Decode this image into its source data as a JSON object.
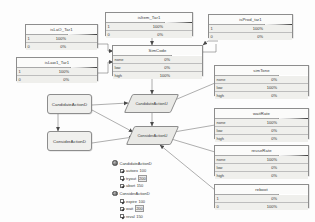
{
  "diagram": {
    "type": "bayesian-influence-diagram",
    "background": "#fdfdfd"
  },
  "nodes": [
    {
      "id": "isLaO_Tar1",
      "kind": "chance",
      "title": "isLaO_Tar1",
      "rows": [
        {
          "label": "1",
          "value": "100%",
          "pct": 100
        },
        {
          "label": "0",
          "value": "0%",
          "pct": 0
        }
      ]
    },
    {
      "id": "isItem_Tar1",
      "kind": "chance",
      "title": "isItem_Tar1",
      "rows": [
        {
          "label": "1",
          "value": "100%",
          "pct": 100
        },
        {
          "label": "0",
          "value": "0%",
          "pct": 0
        }
      ]
    },
    {
      "id": "isProd_Tar1",
      "kind": "chance",
      "title": "isProd_tar1",
      "rows": [
        {
          "label": "1",
          "value": "100%",
          "pct": 100
        },
        {
          "label": "0",
          "value": "0%",
          "pct": 0
        }
      ]
    },
    {
      "id": "isLaw1_Tar1",
      "kind": "chance",
      "title": "isLaw1_Tar1",
      "rows": [
        {
          "label": "1",
          "value": "100%",
          "pct": 100
        },
        {
          "label": "0",
          "value": "0%",
          "pct": 0
        }
      ]
    },
    {
      "id": "SimCode",
      "kind": "chance",
      "title": "SimCode",
      "rows": [
        {
          "label": "none",
          "value": "0%",
          "pct": 0
        },
        {
          "label": "low",
          "value": "0%",
          "pct": 0
        },
        {
          "label": "high",
          "value": "100%",
          "pct": 100
        }
      ]
    },
    {
      "id": "simTone",
      "kind": "chance",
      "title": "simTone",
      "rows": [
        {
          "label": "none",
          "value": "0%",
          "pct": 0
        },
        {
          "label": "low",
          "value": "100%",
          "pct": 100
        },
        {
          "label": "high",
          "value": "0%",
          "pct": 0
        }
      ]
    },
    {
      "id": "waitRate",
      "kind": "chance",
      "title": "waitRate",
      "rows": [
        {
          "label": "none",
          "value": "100%",
          "pct": 100
        },
        {
          "label": "low",
          "value": "0%",
          "pct": 0
        },
        {
          "label": "high",
          "value": "0%",
          "pct": 0
        }
      ]
    },
    {
      "id": "reuseRate",
      "kind": "chance",
      "title": "reuseRate",
      "rows": [
        {
          "label": "none",
          "value": "100%",
          "pct": 100
        },
        {
          "label": "low",
          "value": "0%",
          "pct": 0
        },
        {
          "label": "high",
          "value": "0%",
          "pct": 0
        }
      ]
    },
    {
      "id": "reboot",
      "kind": "chance",
      "title": "reboot",
      "rows": [
        {
          "label": "1",
          "value": "0%",
          "pct": 0
        },
        {
          "label": "0",
          "value": "100%",
          "pct": 100
        }
      ]
    }
  ],
  "decisions": [
    {
      "id": "decision1",
      "label": "CandidateActionD"
    },
    {
      "id": "decision2",
      "label": "ConsiderActionD"
    }
  ],
  "utilities": [
    {
      "id": "utility1",
      "label": "CandidateActionU"
    },
    {
      "id": "utility2",
      "label": "ConsiderActionU"
    }
  ],
  "legend": {
    "groups": [
      {
        "icon": "decision-node-icon",
        "label": "CandidateActionD",
        "items": [
          {
            "name": "autoex",
            "value": "100",
            "highlight": false
          },
          {
            "name": "tryout",
            "value": "200",
            "highlight": true
          },
          {
            "name": "abort",
            "value": "150",
            "highlight": false
          }
        ]
      },
      {
        "icon": "decision-node-icon",
        "label": "ConsiderActionD",
        "items": [
          {
            "name": "expire",
            "value": "100",
            "highlight": false
          },
          {
            "name": "wait",
            "value": "200",
            "highlight": true
          },
          {
            "name": "reval",
            "value": "150",
            "highlight": false
          },
          {
            "name": "abort",
            "value": "100",
            "highlight": false
          }
        ]
      }
    ]
  }
}
